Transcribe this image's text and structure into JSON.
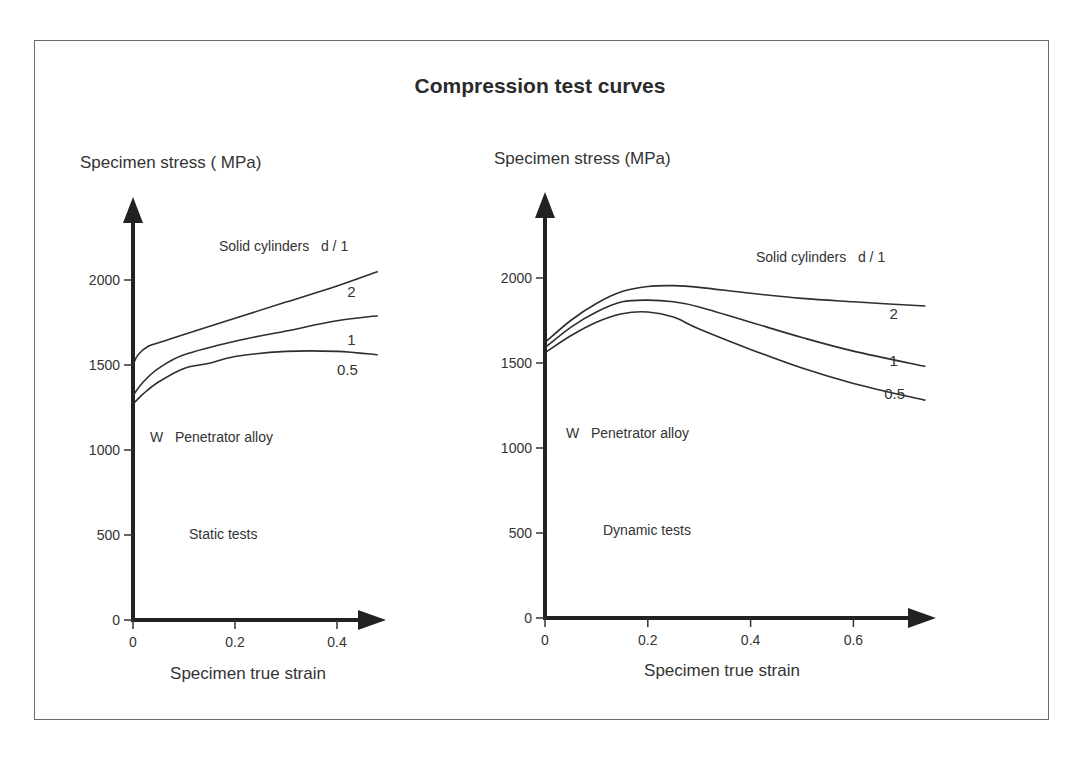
{
  "figure": {
    "title": "Compression test curves",
    "frame_color": "#6b6b6b",
    "line_color": "#2e2e2e"
  },
  "chart_data": [
    {
      "type": "line",
      "title": "Static tests",
      "ylabel": "Specimen stress ( MPa)",
      "xlabel": "Specimen true strain",
      "material_label": "W   Penetrator alloy",
      "legend_title": "Solid cylinders   d / 1",
      "test_label": "Static tests",
      "xlim": [
        0,
        0.48
      ],
      "ylim": [
        0,
        2300
      ],
      "xticks": [
        0,
        0.2,
        0.4
      ],
      "xtick_labels": [
        "0",
        "0.2",
        "0.4"
      ],
      "yticks": [
        0,
        500,
        1000,
        1500,
        2000
      ],
      "ytick_labels": [
        "0",
        "500",
        "1000",
        "1500",
        "2000"
      ],
      "grid": false,
      "series": [
        {
          "name": "2",
          "x": [
            0,
            0.01,
            0.03,
            0.06,
            0.1,
            0.2,
            0.3,
            0.4,
            0.48
          ],
          "values": [
            1500,
            1560,
            1610,
            1640,
            1680,
            1775,
            1870,
            1965,
            2050
          ]
        },
        {
          "name": "1",
          "x": [
            0,
            0.02,
            0.05,
            0.1,
            0.2,
            0.3,
            0.4,
            0.48
          ],
          "values": [
            1320,
            1400,
            1480,
            1560,
            1640,
            1700,
            1760,
            1790
          ]
        },
        {
          "name": "0.5",
          "x": [
            0,
            0.02,
            0.05,
            0.1,
            0.15,
            0.2,
            0.3,
            0.4,
            0.48
          ],
          "values": [
            1270,
            1330,
            1400,
            1480,
            1510,
            1550,
            1580,
            1580,
            1560
          ]
        }
      ],
      "series_label_positions": [
        {
          "name": "2",
          "x": 0.42,
          "y": 1900
        },
        {
          "name": "1",
          "x": 0.42,
          "y": 1620
        },
        {
          "name": "0.5",
          "x": 0.4,
          "y": 1440
        }
      ]
    },
    {
      "type": "line",
      "title": "Dynamic tests",
      "ylabel": "Specimen stress (MPa)",
      "xlabel": "Specimen true strain",
      "material_label": "W   Penetrator alloy",
      "legend_title": "Solid cylinders   d / 1",
      "test_label": "Dynamic tests",
      "xlim": [
        0,
        0.74
      ],
      "ylim": [
        0,
        2300
      ],
      "xticks": [
        0,
        0.2,
        0.4,
        0.6
      ],
      "xtick_labels": [
        "0",
        "0.2",
        "0.4",
        "0.6"
      ],
      "yticks": [
        0,
        500,
        1000,
        1500,
        2000
      ],
      "ytick_labels": [
        "0",
        "500",
        "1000",
        "1500",
        "2000"
      ],
      "grid": false,
      "series": [
        {
          "name": "2",
          "x": [
            0,
            0.05,
            0.1,
            0.15,
            0.2,
            0.25,
            0.3,
            0.4,
            0.5,
            0.6,
            0.74
          ],
          "values": [
            1620,
            1750,
            1850,
            1920,
            1950,
            1955,
            1945,
            1910,
            1880,
            1860,
            1835
          ]
        },
        {
          "name": "1",
          "x": [
            0,
            0.05,
            0.1,
            0.15,
            0.2,
            0.25,
            0.3,
            0.4,
            0.5,
            0.6,
            0.74
          ],
          "values": [
            1590,
            1710,
            1800,
            1860,
            1870,
            1860,
            1830,
            1740,
            1650,
            1570,
            1480
          ]
        },
        {
          "name": "0.5",
          "x": [
            0,
            0.05,
            0.1,
            0.15,
            0.2,
            0.25,
            0.3,
            0.4,
            0.5,
            0.6,
            0.74
          ],
          "values": [
            1560,
            1660,
            1740,
            1790,
            1800,
            1770,
            1700,
            1580,
            1470,
            1380,
            1280
          ]
        }
      ],
      "series_label_positions": [
        {
          "name": "2",
          "x": 0.67,
          "y": 1760
        },
        {
          "name": "1",
          "x": 0.67,
          "y": 1480
        },
        {
          "name": "0.5",
          "x": 0.66,
          "y": 1290
        }
      ]
    }
  ]
}
